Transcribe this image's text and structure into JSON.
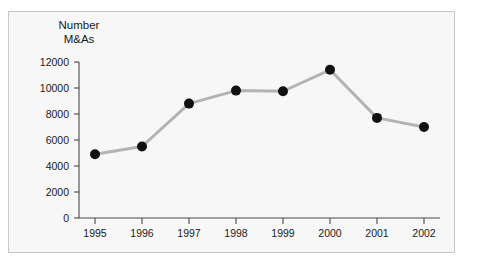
{
  "panel": {
    "background_color": "#f7f7f7",
    "border_color": "#c8c8c8"
  },
  "chart_data": {
    "type": "line",
    "title": "",
    "title_lines": [
      "Number",
      "M&As"
    ],
    "ylabel": "Number M&As",
    "xlabel": "",
    "categories": [
      "1995",
      "1996",
      "1997",
      "1998",
      "1999",
      "2000",
      "2001",
      "2002"
    ],
    "values": [
      4900,
      5500,
      8800,
      9800,
      9750,
      11400,
      7700,
      7000
    ],
    "series": [
      {
        "name": "Number M&As",
        "values": [
          4900,
          5500,
          8800,
          9800,
          9750,
          11400,
          7700,
          7000
        ]
      }
    ],
    "ylim": [
      0,
      12000
    ],
    "ytick_values": [
      0,
      2000,
      4000,
      6000,
      8000,
      10000,
      12000
    ],
    "ytick_labels": [
      "0",
      "2000",
      "4000",
      "6000",
      "8000",
      "10000",
      "12000"
    ],
    "xtick_labels": [
      "1995",
      "1996",
      "1997",
      "1998",
      "1999",
      "2000",
      "2001",
      "2002"
    ],
    "grid": false,
    "legend": false,
    "legend_position": "none",
    "line_color": "#b3b3b3",
    "line_width": 3,
    "marker_color": "#111111",
    "marker_shape": "circle",
    "marker_radius": 5,
    "axis_color": "#4a4a4a"
  }
}
